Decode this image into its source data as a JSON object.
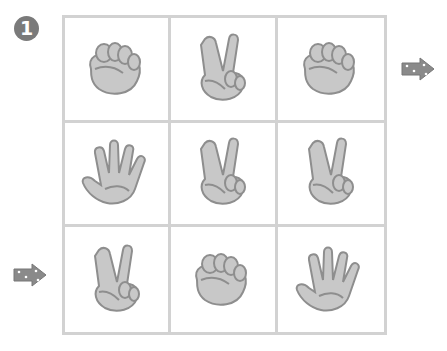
{
  "puzzle": {
    "number": "1",
    "grid": [
      [
        "rock",
        "scissors",
        "rock"
      ],
      [
        "paper",
        "scissors",
        "scissors"
      ],
      [
        "scissors",
        "rock",
        "paper"
      ]
    ],
    "start_arrow": {
      "row": 3,
      "side": "left"
    },
    "end_arrow": {
      "row": 1,
      "side": "right"
    }
  },
  "colors": {
    "hand_fill": "#c8c8c8",
    "hand_stroke": "#8e8e8e",
    "grid_line": "#d2d2d2",
    "badge": "#7a7a7a",
    "arrow": "#8a8a8a"
  }
}
